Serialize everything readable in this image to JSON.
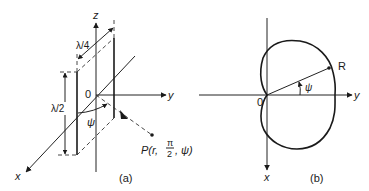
{
  "panel_a": {
    "caption": "(a)",
    "axes": {
      "z": "z",
      "y": "y",
      "x": "x",
      "origin": "0"
    },
    "dimensions": {
      "height": "λ/2",
      "spacing": "λ/4"
    },
    "angle": "ψ",
    "point": {
      "prefix": "P(r, ",
      "pi_num": "π",
      "pi_den": "2",
      "suffix": ", ψ)"
    }
  },
  "panel_b": {
    "caption": "(b)",
    "axes": {
      "y": "y",
      "x": "x",
      "origin": "0"
    },
    "point_label": "R",
    "angle": "ψ",
    "pattern": "cardioid"
  }
}
